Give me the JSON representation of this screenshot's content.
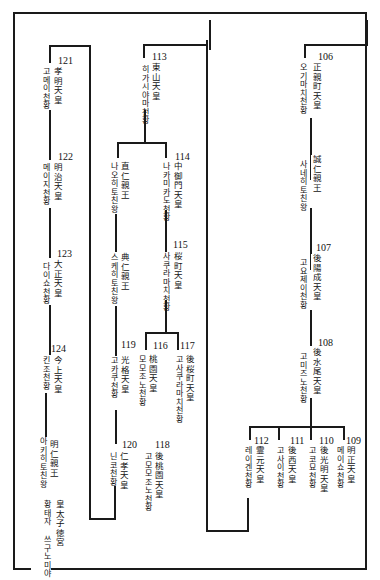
{
  "diagram": {
    "type": "genealogy-tree",
    "emperors": [
      {
        "num": "106",
        "kanji": "正親町天皇",
        "korean": "오기마치천황"
      },
      {
        "num": "",
        "kanji": "誠仁親王",
        "korean": "사네히토친왕"
      },
      {
        "num": "107",
        "kanji": "後陽成天皇",
        "korean": "고요제이천황"
      },
      {
        "num": "108",
        "kanji": "後水尾天皇",
        "korean": "고미즈노천황"
      },
      {
        "num": "109",
        "kanji": "明正天皇",
        "korean": "메이쇼천황"
      },
      {
        "num": "110",
        "kanji": "後光明天皇",
        "korean": "고코묘천황"
      },
      {
        "num": "111",
        "kanji": "後西天皇",
        "korean": "고사이천황"
      },
      {
        "num": "112",
        "kanji": "霊元天皇",
        "korean": "레이겐천황"
      },
      {
        "num": "113",
        "kanji": "東山天皇",
        "korean": "히가시야마천황"
      },
      {
        "num": "",
        "kanji": "直仁親王",
        "korean": "나오히토친왕"
      },
      {
        "num": "114",
        "kanji": "中御門天皇",
        "korean": "나카미카도천황"
      },
      {
        "num": "",
        "kanji": "典仁親王",
        "korean": "스케히토친왕"
      },
      {
        "num": "115",
        "kanji": "桜町天皇",
        "korean": "사쿠라마치천황"
      },
      {
        "num": "116",
        "kanji": "桃園天皇",
        "korean": "모모조노천황"
      },
      {
        "num": "117",
        "kanji": "後桜町天皇",
        "korean": "고사쿠라마치천황"
      },
      {
        "num": "118",
        "kanji": "後桃園天皇",
        "korean": "고모모조노천황"
      },
      {
        "num": "119",
        "kanji": "光格天皇",
        "korean": "고카쿠천황"
      },
      {
        "num": "120",
        "kanji": "仁孝天皇",
        "korean": "닌코천황"
      },
      {
        "num": "121",
        "kanji": "孝明天皇",
        "korean": "고메이천황"
      },
      {
        "num": "122",
        "kanji": "明治天皇",
        "korean": "메이지천황"
      },
      {
        "num": "123",
        "kanji": "大正天皇",
        "korean": "다이쇼천황"
      },
      {
        "num": "124",
        "kanji": "今上天皇",
        "korean": "킨조천황"
      },
      {
        "num": "",
        "kanji": "明仁親王",
        "korean": "아키히토친왕"
      },
      {
        "num": "",
        "kanji": "皇太子徳宮",
        "korean": "황태자 쓰구노미야"
      }
    ]
  }
}
